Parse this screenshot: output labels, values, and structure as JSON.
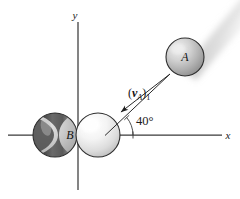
{
  "figure": {
    "background_color": "#ffffff",
    "width": 240,
    "height": 199
  },
  "axes": {
    "x_label": "x",
    "y_label": "y",
    "origin": {
      "x": 78,
      "y": 135
    },
    "x_axis": {
      "start_x": 8,
      "end_x": 222,
      "y": 135
    },
    "y_axis": {
      "x": 78,
      "start_y": 22,
      "end_y": 190
    },
    "line_color": "#3a3a3a"
  },
  "balls": [
    {
      "id": "ball-a",
      "label": "A",
      "cx": 185,
      "cy": 57,
      "r": 19,
      "fill_light": "#d8d8d8",
      "fill_dark": "#9a9a9a",
      "outline_color": "#2e2e2e"
    },
    {
      "id": "ball-b-striped",
      "label": "B",
      "cx": 55,
      "cy": 135,
      "r": 22,
      "fill_light": "#cfcfcf",
      "fill_dark": "#4a4a4a",
      "outline_color": "#2e2e2e"
    },
    {
      "id": "ball-b-light",
      "label": "",
      "cx": 98,
      "cy": 135,
      "r": 22,
      "fill_light": "#fbfbfb",
      "fill_dark": "#c6c6c6",
      "outline_color": "#8a8a8a"
    }
  ],
  "velocity_vector": {
    "label_prefix": "(",
    "label_symbol": "v",
    "label_symbol_sub": "A",
    "label_suffix": ")",
    "label_index": "1",
    "full_label": "(vA)1",
    "tail": {
      "x": 168,
      "y": 72
    },
    "head": {
      "x": 118,
      "y": 114
    },
    "line_color": "#2b2b2b"
  },
  "angle": {
    "value": "40",
    "unit": "°",
    "label": "40°",
    "vertex": {
      "x": 118,
      "y": 135
    },
    "arc_radius": 28,
    "degrees": 40,
    "label_position": {
      "x": 134,
      "y": 122
    }
  },
  "motion_blur": {
    "description": "motion blur streak trailing ball A toward upper right",
    "angle_degrees": 40,
    "color": "#cccccc"
  }
}
